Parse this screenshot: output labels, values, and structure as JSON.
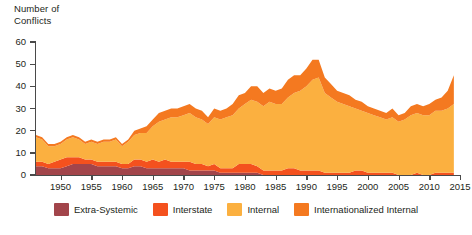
{
  "chart_data": {
    "type": "area",
    "stacked": true,
    "title": "",
    "ylabel": "Number of\nConflicts",
    "xlabel": "",
    "ylim": [
      0,
      60
    ],
    "xlim": [
      1946,
      2015
    ],
    "yticks": [
      0,
      10,
      20,
      30,
      40,
      50,
      60
    ],
    "xticks": [
      1950,
      1955,
      1960,
      1965,
      1970,
      1975,
      1980,
      1985,
      1990,
      1995,
      2000,
      2005,
      2010,
      2015
    ],
    "grid": false,
    "legend_position": "bottom",
    "colors": {
      "extra_systemic": "#a2454b",
      "interstate": "#f4511e",
      "internal": "#fbb040",
      "internationalized_internal": "#f47920"
    },
    "x": [
      1946,
      1947,
      1948,
      1949,
      1950,
      1951,
      1952,
      1953,
      1954,
      1955,
      1956,
      1957,
      1958,
      1959,
      1960,
      1961,
      1962,
      1963,
      1964,
      1965,
      1966,
      1967,
      1968,
      1969,
      1970,
      1971,
      1972,
      1973,
      1974,
      1975,
      1976,
      1977,
      1978,
      1979,
      1980,
      1981,
      1982,
      1983,
      1984,
      1985,
      1986,
      1987,
      1988,
      1989,
      1990,
      1991,
      1992,
      1993,
      1994,
      1995,
      1996,
      1997,
      1998,
      1999,
      2000,
      2001,
      2002,
      2003,
      2004,
      2005,
      2006,
      2007,
      2008,
      2009,
      2010,
      2011,
      2012,
      2013,
      2014
    ],
    "series": [
      {
        "name": "Extra-Systemic",
        "values": [
          4,
          4,
          3,
          3,
          3,
          4,
          5,
          5,
          5,
          5,
          4,
          4,
          4,
          4,
          3,
          3,
          4,
          4,
          3,
          3,
          3,
          3,
          3,
          3,
          3,
          2,
          2,
          2,
          2,
          2,
          1,
          1,
          1,
          1,
          1,
          1,
          1,
          0,
          0,
          0,
          0,
          0,
          0,
          0,
          0,
          0,
          0,
          0,
          0,
          0,
          0,
          0,
          0,
          0,
          0,
          0,
          0,
          0,
          0,
          0,
          0,
          0,
          0,
          0,
          0,
          0,
          0,
          0,
          0
        ]
      },
      {
        "name": "Interstate",
        "values": [
          2,
          2,
          2,
          3,
          4,
          4,
          3,
          3,
          2,
          2,
          2,
          2,
          2,
          2,
          2,
          2,
          3,
          3,
          3,
          4,
          3,
          4,
          3,
          3,
          3,
          4,
          3,
          3,
          2,
          3,
          2,
          2,
          2,
          4,
          4,
          4,
          3,
          2,
          2,
          2,
          2,
          3,
          3,
          2,
          2,
          2,
          2,
          1,
          1,
          1,
          1,
          1,
          2,
          2,
          1,
          1,
          1,
          1,
          1,
          0,
          0,
          0,
          1,
          0,
          0,
          1,
          1,
          1,
          1
        ]
      },
      {
        "name": "Internal",
        "values": [
          11,
          10,
          8,
          7,
          7,
          8,
          9,
          8,
          7,
          8,
          8,
          9,
          9,
          10,
          8,
          10,
          11,
          12,
          13,
          15,
          18,
          18,
          20,
          20,
          21,
          22,
          21,
          20,
          19,
          21,
          22,
          23,
          24,
          25,
          27,
          29,
          29,
          29,
          31,
          30,
          30,
          32,
          34,
          36,
          38,
          41,
          42,
          36,
          34,
          32,
          31,
          30,
          28,
          27,
          27,
          26,
          25,
          24,
          25,
          24,
          25,
          27,
          27,
          27,
          27,
          28,
          28,
          29,
          31
        ]
      },
      {
        "name": "Internationalized Internal",
        "values": [
          1,
          1,
          1,
          1,
          1,
          1,
          1,
          1,
          1,
          1,
          1,
          1,
          1,
          1,
          1,
          1,
          2,
          2,
          3,
          3,
          4,
          4,
          4,
          4,
          4,
          4,
          4,
          4,
          3,
          4,
          4,
          4,
          5,
          6,
          5,
          6,
          7,
          6,
          6,
          6,
          7,
          8,
          8,
          7,
          8,
          9,
          8,
          7,
          6,
          5,
          5,
          5,
          4,
          4,
          3,
          3,
          3,
          3,
          4,
          3,
          3,
          4,
          4,
          4,
          5,
          5,
          6,
          8,
          13
        ]
      }
    ]
  },
  "legend": {
    "items": [
      {
        "label": "Extra-Systemic",
        "color": "#a2454b"
      },
      {
        "label": "Interstate",
        "color": "#f4511e"
      },
      {
        "label": "Internal",
        "color": "#fbb040"
      },
      {
        "label": "Internationalized Internal",
        "color": "#f47920"
      }
    ]
  }
}
